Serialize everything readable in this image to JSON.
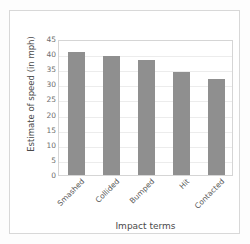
{
  "chart_data": {
    "type": "bar",
    "title": "",
    "subtitle": "",
    "xlabel": "Impact terms",
    "ylabel": "Estimate of speed (in mph)",
    "categories": [
      "Smashed",
      "Collided",
      "Bumped",
      "Hit",
      "Contacted"
    ],
    "values": [
      40.8,
      39.3,
      38.1,
      34.0,
      31.8
    ],
    "ylim": [
      0,
      45
    ],
    "ytick_labels": [
      "0",
      "5",
      "10",
      "15",
      "20",
      "25",
      "30",
      "35",
      "40",
      "45"
    ],
    "ytick_values": [
      0,
      5,
      10,
      15,
      20,
      25,
      30,
      35,
      40,
      45
    ],
    "grid": true,
    "grid_axis": "y",
    "legend": false,
    "legend_position": "none",
    "bar_color": "#8f8f8f",
    "grid_color": "#ececec",
    "axis_color": "#d5d5d5",
    "text_color": "#555555",
    "background_color": "#ffffff",
    "xtick_rotation": -45
  }
}
